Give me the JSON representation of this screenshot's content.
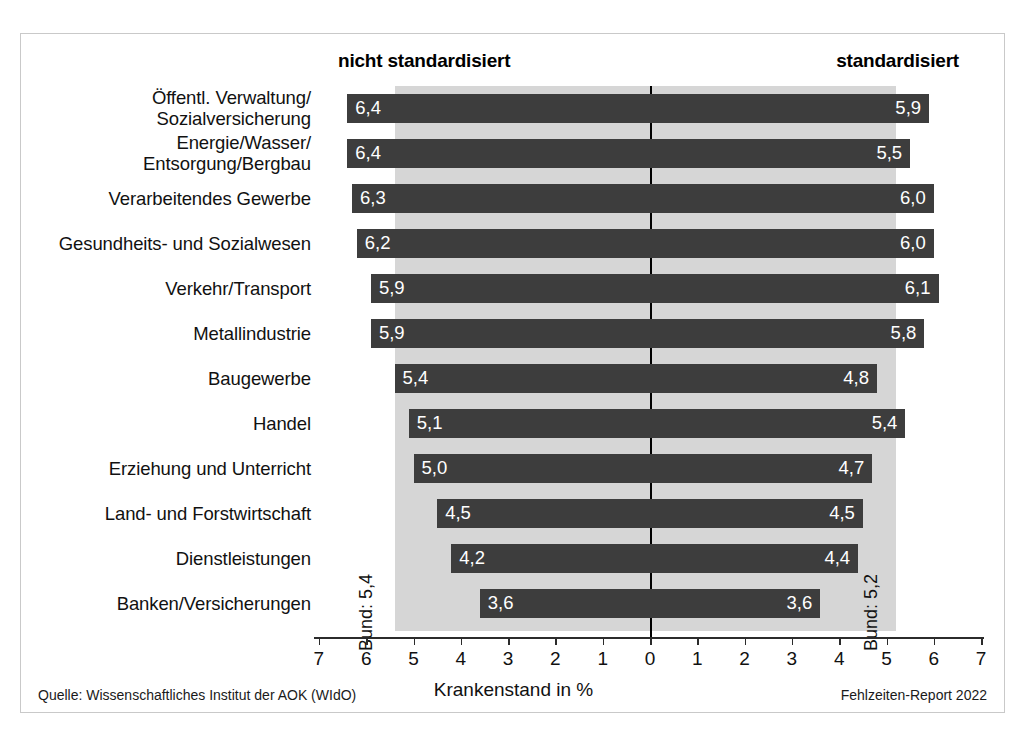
{
  "headers": {
    "left": "nicht standardisiert",
    "right": "standardisiert"
  },
  "bund": {
    "left_label": "Bund: 5,4",
    "right_label": "Bund: 5,2",
    "left_value": 5.4,
    "right_value": 5.2
  },
  "axis": {
    "title": "Krankenstand in %",
    "ticks": [
      "7",
      "6",
      "5",
      "4",
      "3",
      "2",
      "1",
      "0",
      "1",
      "2",
      "3",
      "4",
      "5",
      "6",
      "7"
    ]
  },
  "footer": {
    "source": "Quelle: Wissenschaftliches Institut der AOK (WIdO)",
    "report": "Fehlzeiten-Report 2022"
  },
  "colors": {
    "bar": "#3d3d3d",
    "band": "#d6d6d6",
    "axis": "#2b2b2b",
    "frame": "#c9c9c9"
  },
  "chart_data": {
    "type": "bar",
    "title": "",
    "xlabel": "Krankenstand in %",
    "ylabel": "",
    "orientation": "horizontal",
    "layout": "diverging-back-to-back",
    "xlim": [
      0,
      7
    ],
    "grid": false,
    "legend_position": "top",
    "categories": [
      "Öffentl. Verwaltung/\nSozialversicherung",
      "Energie/Wasser/\nEntsorgung/Bergbau",
      "Verarbeitendes Gewerbe",
      "Gesundheits- und Sozialwesen",
      "Verkehr/Transport",
      "Metallindustrie",
      "Baugewerbe",
      "Handel",
      "Erziehung und Unterricht",
      "Land- und Forstwirtschaft",
      "Dienstleistungen",
      "Banken/Versicherungen"
    ],
    "series": [
      {
        "name": "nicht standardisiert",
        "side": "left",
        "values": [
          6.4,
          6.4,
          6.3,
          6.2,
          5.9,
          5.9,
          5.4,
          5.1,
          5.0,
          4.5,
          4.2,
          3.6
        ],
        "labels": [
          "6,4",
          "6,4",
          "6,3",
          "6,2",
          "5,9",
          "5,9",
          "5,4",
          "5,1",
          "5,0",
          "4,5",
          "4,2",
          "3,6"
        ],
        "reference_line": 5.4,
        "reference_label": "Bund: 5,4"
      },
      {
        "name": "standardisiert",
        "side": "right",
        "values": [
          5.9,
          5.5,
          6.0,
          6.0,
          6.1,
          5.8,
          4.8,
          5.4,
          4.7,
          4.5,
          4.4,
          3.6
        ],
        "labels": [
          "5,9",
          "5,5",
          "6,0",
          "6,0",
          "6,1",
          "5,8",
          "4,8",
          "5,4",
          "4,7",
          "4,5",
          "4,4",
          "3,6"
        ],
        "reference_line": 5.2,
        "reference_label": "Bund: 5,2"
      }
    ],
    "annotations": [
      "Quelle: Wissenschaftliches Institut der AOK (WIdO)",
      "Fehlzeiten-Report 2022"
    ]
  },
  "rows": [
    {
      "label_line1": "Öffentl. Verwaltung/",
      "label_line2": "Sozialversicherung",
      "left": "6,4",
      "right": "5,9"
    },
    {
      "label_line1": "Energie/Wasser/",
      "label_line2": "Entsorgung/Bergbau",
      "left": "6,4",
      "right": "5,5"
    },
    {
      "label_line1": "Verarbeitendes Gewerbe",
      "label_line2": "",
      "left": "6,3",
      "right": "6,0"
    },
    {
      "label_line1": "Gesundheits- und Sozialwesen",
      "label_line2": "",
      "left": "6,2",
      "right": "6,0"
    },
    {
      "label_line1": "Verkehr/Transport",
      "label_line2": "",
      "left": "5,9",
      "right": "6,1"
    },
    {
      "label_line1": "Metallindustrie",
      "label_line2": "",
      "left": "5,9",
      "right": "5,8"
    },
    {
      "label_line1": "Baugewerbe",
      "label_line2": "",
      "left": "5,4",
      "right": "4,8"
    },
    {
      "label_line1": "Handel",
      "label_line2": "",
      "left": "5,1",
      "right": "5,4"
    },
    {
      "label_line1": "Erziehung und Unterricht",
      "label_line2": "",
      "left": "5,0",
      "right": "4,7"
    },
    {
      "label_line1": "Land- und Forstwirtschaft",
      "label_line2": "",
      "left": "4,5",
      "right": "4,5"
    },
    {
      "label_line1": "Dienstleistungen",
      "label_line2": "",
      "left": "4,2",
      "right": "4,4"
    },
    {
      "label_line1": "Banken/Versicherungen",
      "label_line2": "",
      "left": "3,6",
      "right": "3,6"
    }
  ]
}
